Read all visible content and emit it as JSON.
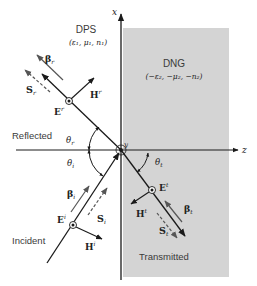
{
  "regions": {
    "left": {
      "name": "DPS",
      "params": "(ε₁, μ₁, n₁)"
    },
    "right": {
      "name": "DNG",
      "params": "(−ε₂, −μ₂, −n₂)"
    }
  },
  "axes": {
    "x": "x",
    "y": "y",
    "z": "z"
  },
  "wave_labels": {
    "reflected": "Reflected",
    "incident": "Incident",
    "transmitted": "Transmitted"
  },
  "angles": {
    "reflected": "θ",
    "reflected_sub": "r",
    "incident": "θ",
    "incident_sub": "i",
    "transmitted": "θ",
    "transmitted_sub": "t"
  },
  "vectors": {
    "beta_r": "β",
    "beta_r_sub": "r",
    "S_r": "S",
    "S_r_sub": "r",
    "E_r": "E",
    "E_r_sup": "r",
    "H_r": "H",
    "H_r_sup": "r",
    "beta_i": "β",
    "beta_i_sub": "i",
    "S_i": "S",
    "S_i_sub": "i",
    "E_i": "E",
    "E_i_sup": "i",
    "H_i": "H",
    "H_i_sup": "i",
    "beta_t": "β",
    "beta_t_sub": "t",
    "S_t": "S",
    "S_t_sub": "t",
    "E_t": "E",
    "E_t_sup": "t",
    "H_t": "H",
    "H_t_sup": "t"
  },
  "colors": {
    "dng_fill": "#d4d4d4",
    "line": "#1a1a1a",
    "gray_arrow": "#555555"
  }
}
